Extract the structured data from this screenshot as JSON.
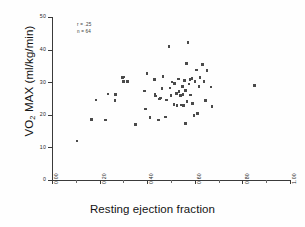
{
  "chart_data": {
    "type": "scatter",
    "title": "",
    "xlabel": "Resting ejection fraction",
    "ylabel_main": "VO",
    "ylabel_sub": "2",
    "ylabel_rest": " MAX (ml/kg/min)",
    "ylabel_full": "VO2 MAX (ml/kg/min)",
    "xlim": [
      0.0,
      1.0
    ],
    "ylim": [
      0,
      50
    ],
    "xticks": [
      "0.00",
      "0.20",
      "0.40",
      "0.60",
      "0.80",
      "1.00"
    ],
    "xtick_values": [
      0.0,
      0.2,
      0.4,
      0.6,
      0.8,
      1.0
    ],
    "yticks": [
      "50",
      "40",
      "30",
      "20",
      "10",
      "0"
    ],
    "ytick_values": [
      50,
      40,
      30,
      20,
      10,
      0
    ],
    "grid": false,
    "legend_position": "top-left",
    "annotations": [
      {
        "name": "correlation",
        "text": "r = .25"
      },
      {
        "name": "sample-size",
        "text": "n = 64"
      }
    ],
    "marker": "square",
    "marker_color": "#4a4a4a",
    "axis_color": "#3a3a3a",
    "points": [
      [
        0.105,
        12.0
      ],
      [
        0.165,
        18.6
      ],
      [
        0.185,
        24.5
      ],
      [
        0.225,
        18.4
      ],
      [
        0.235,
        26.4
      ],
      [
        0.265,
        24.3
      ],
      [
        0.268,
        26.2
      ],
      [
        0.295,
        31.4
      ],
      [
        0.302,
        31.6
      ],
      [
        0.3,
        30.2
      ],
      [
        0.318,
        30.2
      ],
      [
        0.352,
        17.1
      ],
      [
        0.388,
        27.3
      ],
      [
        0.392,
        21.8
      ],
      [
        0.4,
        32.6
      ],
      [
        0.412,
        19.1
      ],
      [
        0.43,
        30.8
      ],
      [
        0.432,
        26.3
      ],
      [
        0.436,
        25.8
      ],
      [
        0.448,
        18.4
      ],
      [
        0.452,
        24.9
      ],
      [
        0.455,
        25.1
      ],
      [
        0.462,
        28.0
      ],
      [
        0.466,
        31.7
      ],
      [
        0.478,
        19.3
      ],
      [
        0.48,
        24.6
      ],
      [
        0.492,
        40.9
      ],
      [
        0.495,
        28.2
      ],
      [
        0.5,
        26.0
      ],
      [
        0.505,
        30.1
      ],
      [
        0.512,
        23.1
      ],
      [
        0.515,
        29.6
      ],
      [
        0.522,
        26.6
      ],
      [
        0.525,
        22.9
      ],
      [
        0.532,
        31.0
      ],
      [
        0.534,
        27.2
      ],
      [
        0.54,
        25.9
      ],
      [
        0.542,
        23.0
      ],
      [
        0.548,
        28.6
      ],
      [
        0.55,
        26.2
      ],
      [
        0.552,
        22.8
      ],
      [
        0.556,
        30.6
      ],
      [
        0.56,
        17.4
      ],
      [
        0.562,
        27.5
      ],
      [
        0.566,
        35.8
      ],
      [
        0.568,
        24.0
      ],
      [
        0.572,
        42.2
      ],
      [
        0.575,
        29.4
      ],
      [
        0.58,
        30.9
      ],
      [
        0.582,
        26.1
      ],
      [
        0.588,
        31.1
      ],
      [
        0.59,
        23.5
      ],
      [
        0.596,
        19.8
      ],
      [
        0.6,
        30.2
      ],
      [
        0.606,
        33.8
      ],
      [
        0.612,
        20.4
      ],
      [
        0.618,
        28.7
      ],
      [
        0.622,
        31.5
      ],
      [
        0.632,
        35.4
      ],
      [
        0.638,
        30.3
      ],
      [
        0.645,
        24.3
      ],
      [
        0.652,
        33.6
      ],
      [
        0.668,
        28.5
      ],
      [
        0.672,
        22.5
      ],
      [
        0.852,
        28.9
      ]
    ]
  }
}
